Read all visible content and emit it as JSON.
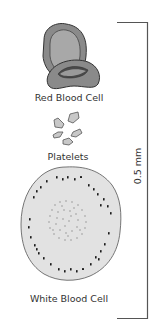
{
  "diagram": {
    "cells": [
      {
        "id": "rbc",
        "label": "Red Blood Cell"
      },
      {
        "id": "platelets",
        "label": "Platelets"
      },
      {
        "id": "wbc",
        "label": "White Blood Cell"
      }
    ],
    "scale_bar": {
      "label": "0.5 mm"
    },
    "colors": {
      "rbc_fill": "#8a8a8a",
      "rbc_inner": "#a3a3a3",
      "platelet_fill": "#c8c8c8",
      "wbc_fill": "#e2e2e2",
      "granule": "#1a1a1a",
      "line": "#555555"
    }
  }
}
